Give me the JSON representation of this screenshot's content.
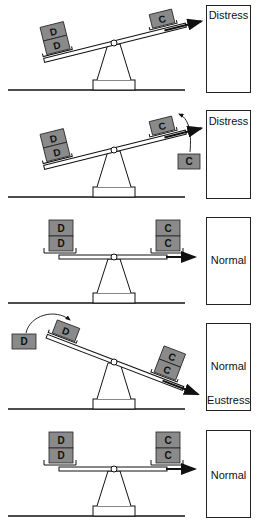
{
  "figure": {
    "panels": [
      {
        "id": 1,
        "left_blocks": [
          "D",
          "D"
        ],
        "right_blocks": [
          "C"
        ],
        "tilt": "left-down",
        "state_labels": [
          "Distress"
        ],
        "annotation": ""
      },
      {
        "id": 2,
        "left_blocks": [
          "D",
          "D"
        ],
        "right_blocks": [
          "C"
        ],
        "tilt": "left-down",
        "added_block": "C",
        "state_labels": [
          "Distress"
        ],
        "annotation": "C block added to right side"
      },
      {
        "id": 3,
        "left_blocks": [
          "D",
          "D"
        ],
        "right_blocks": [
          "C",
          "C"
        ],
        "tilt": "level",
        "state_labels": [
          "Normal"
        ],
        "annotation": ""
      },
      {
        "id": 4,
        "left_blocks": [
          "D"
        ],
        "right_blocks": [
          "C",
          "C"
        ],
        "tilt": "right-down",
        "removed_block": "D",
        "state_labels": [
          "Normal",
          "Eustress"
        ],
        "annotation": "D block removed from left side"
      },
      {
        "id": 5,
        "left_blocks": [
          "D",
          "D"
        ],
        "right_blocks": [
          "C",
          "C"
        ],
        "tilt": "level",
        "state_labels": [
          "Normal"
        ],
        "annotation": ""
      }
    ]
  },
  "colors": {
    "block_fill": "#8a8a8a",
    "line": "#111111",
    "background": "#ffffff"
  }
}
